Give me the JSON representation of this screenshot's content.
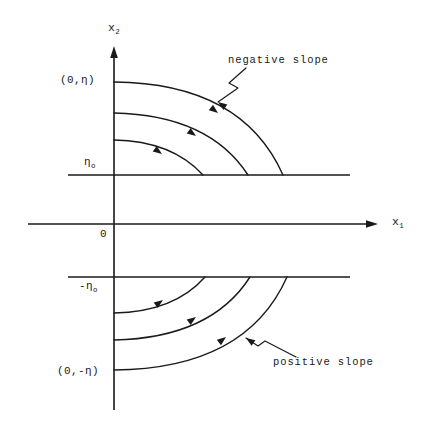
{
  "figure": {
    "background_color": "#ffffff",
    "stroke_color": "#1a1a1a",
    "axes": {
      "x_axis_label": "x",
      "x_axis_subscript": "1",
      "y_axis_label": "x",
      "y_axis_subscript": "2",
      "origin_label": "0"
    },
    "labels": {
      "eta_top": "(0,η)",
      "eta_zero": "η",
      "eta_zero_sub": "o",
      "neg_eta_zero": "-η",
      "neg_eta_zero_sub": "o",
      "eta_bottom": "(0,-η)"
    },
    "annotations": {
      "negative_slope": "negative slope",
      "positive_slope": "positive slope"
    }
  },
  "chart_data": {
    "type": "line",
    "title": "",
    "subtitle": "",
    "xlabel": "x1",
    "ylabel": "x2",
    "grid": false,
    "legend": "none",
    "xlim": [
      0,
      430
    ],
    "ylim": [
      435,
      0
    ],
    "axis_lines": {
      "x_axis": {
        "x_start": 28,
        "x_end": 378,
        "y": 224,
        "arrow": "right"
      },
      "y_axis": {
        "y_start": 410,
        "y_end": 48,
        "x": 114,
        "arrow": "up"
      },
      "eta_zero_line": {
        "x_start": 68,
        "x_end": 350,
        "y": 175,
        "arrow": "none"
      },
      "neg_eta_zero_line": {
        "x_start": 68,
        "x_end": 350,
        "y": 277,
        "arrow": "none"
      }
    },
    "series": [
      {
        "name": "upper-trajectory-inner",
        "slope": "negative",
        "start": [
          114,
          140
        ],
        "end": [
          203,
          175
        ],
        "control": [
          172,
          141
        ],
        "arrow_at": [
          162,
          154
        ],
        "arrow_angle": 36
      },
      {
        "name": "upper-trajectory-middle",
        "slope": "negative",
        "start": [
          114,
          113
        ],
        "end": [
          248,
          175
        ],
        "control": [
          209,
          115
        ],
        "arrow_at": [
          196,
          136
        ],
        "arrow_angle": 36
      },
      {
        "name": "upper-trajectory-outer",
        "slope": "negative",
        "start": [
          114,
          82
        ],
        "end": [
          283,
          175
        ],
        "control": [
          242,
          83
        ],
        "arrow_at": [
          218,
          113
        ],
        "arrow_angle": 38
      },
      {
        "name": "lower-trajectory-inner",
        "slope": "positive",
        "start": [
          114,
          313
        ],
        "end": [
          205,
          277
        ],
        "control": [
          174,
          312
        ],
        "arrow_at": [
          163,
          300
        ],
        "arrow_angle": -36
      },
      {
        "name": "lower-trajectory-middle",
        "slope": "positive",
        "start": [
          114,
          340
        ],
        "end": [
          250,
          277
        ],
        "control": [
          211,
          338
        ],
        "arrow_at": [
          196,
          317
        ],
        "arrow_angle": -36
      },
      {
        "name": "lower-trajectory-outer",
        "slope": "positive",
        "start": [
          114,
          370
        ],
        "end": [
          287,
          277
        ],
        "control": [
          246,
          369
        ],
        "arrow_at": [
          226,
          337
        ],
        "arrow_angle": -38
      }
    ],
    "pointers": [
      {
        "name": "negative-slope-pointer",
        "label": "negative slope",
        "path": "M 246,68 L 229,83 L 238,88 L 218,102",
        "arrow_tip": [
          218,
          102
        ],
        "arrow_angle": 215
      },
      {
        "name": "positive-slope-pointer",
        "label": "positive slope",
        "path": "M 296,357 L 265,341 L 258,346 L 246,338",
        "arrow_tip": [
          246,
          338
        ],
        "arrow_angle": 214
      }
    ]
  }
}
